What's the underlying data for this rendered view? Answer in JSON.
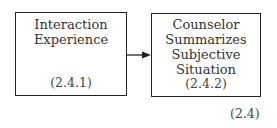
{
  "boxes": [
    {
      "title_lines": [
        "Interaction",
        "Experience"
      ],
      "number": "(2.4.1)"
    },
    {
      "title_lines": [
        "Counselor",
        "Summarizes",
        "Subjective",
        "Situation"
      ],
      "number": "(2.4.2)"
    }
  ],
  "equation_label": "(2.4)"
}
